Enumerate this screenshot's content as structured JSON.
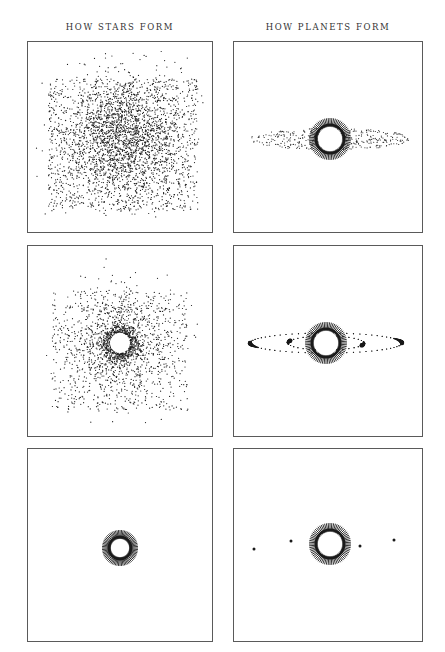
{
  "headings": {
    "left": "HOW STARS FORM",
    "right": "HOW PLANETS FORM"
  },
  "colors": {
    "ink": "#1a1a1a",
    "border": "#5a5a5a",
    "heading": "#333333",
    "background": "#ffffff"
  },
  "panels": [
    {
      "id": "stars-stage-1",
      "column": "left",
      "stage": 1,
      "description": "diffuse gas and dust cloud",
      "box": {
        "x": 27,
        "y": 41,
        "w": 186,
        "h": 192
      },
      "cloud": {
        "cx": 95,
        "cy": 95,
        "spread": 44,
        "count": 3200
      },
      "star": null
    },
    {
      "id": "planets-stage-1",
      "column": "right",
      "stage": 1,
      "description": "young star with flat protoplanetary disk",
      "box": {
        "x": 233,
        "y": 41,
        "w": 190,
        "h": 192
      },
      "star": {
        "cx": 96,
        "cy": 97,
        "r_inner": 12,
        "r_outer": 21,
        "rays": 72
      },
      "disk": {
        "cx": 96,
        "cy": 97,
        "rx": 80,
        "ry": 11,
        "count": 380
      }
    },
    {
      "id": "stars-stage-2",
      "column": "left",
      "stage": 2,
      "description": "protostar collapsing at center of cloud",
      "box": {
        "x": 27,
        "y": 245,
        "w": 186,
        "h": 192
      },
      "cloud": {
        "cx": 92,
        "cy": 97,
        "spread": 40,
        "count": 1500
      },
      "star": {
        "cx": 92,
        "cy": 97,
        "r_inner": 10,
        "r_outer": 17,
        "rays": 0,
        "halo_count": 600
      }
    },
    {
      "id": "planets-stage-2",
      "column": "right",
      "stage": 2,
      "description": "disk gathering into planet orbits",
      "box": {
        "x": 233,
        "y": 245,
        "w": 190,
        "h": 192
      },
      "star": {
        "cx": 92,
        "cy": 97,
        "r_inner": 12,
        "r_outer": 21,
        "rays": 72
      },
      "orbits": [
        {
          "rx": 76,
          "ry": 10,
          "clump_angle": 180
        },
        {
          "rx": 76,
          "ry": 10,
          "clump_angle": 0
        },
        {
          "rx": 38,
          "ry": 7,
          "clump_angle": 200
        },
        {
          "rx": 38,
          "ry": 7,
          "clump_angle": 20
        }
      ]
    },
    {
      "id": "stars-stage-3",
      "column": "left",
      "stage": 3,
      "description": "fully formed star",
      "box": {
        "x": 27,
        "y": 448,
        "w": 186,
        "h": 194
      },
      "star": {
        "cx": 92,
        "cy": 99,
        "r_inner": 9,
        "r_outer": 18,
        "rays": 72
      }
    },
    {
      "id": "planets-stage-3",
      "column": "right",
      "stage": 3,
      "description": "star with formed planets",
      "box": {
        "x": 233,
        "y": 448,
        "w": 190,
        "h": 194
      },
      "star": {
        "cx": 96,
        "cy": 95,
        "r_inner": 12,
        "r_outer": 21,
        "rays": 72
      },
      "planets": [
        {
          "x": 20,
          "y": 100
        },
        {
          "x": 57,
          "y": 92
        },
        {
          "x": 126,
          "y": 97
        },
        {
          "x": 160,
          "y": 91
        }
      ]
    }
  ]
}
